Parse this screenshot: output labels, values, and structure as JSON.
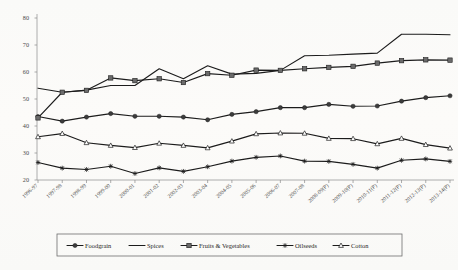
{
  "chart_data": {
    "type": "line",
    "title": "",
    "xlabel": "",
    "ylabel": "",
    "ylim": [
      20,
      80
    ],
    "yticks": [
      20,
      30,
      40,
      50,
      60,
      70,
      80
    ],
    "grid": false,
    "legend_position": "bottom",
    "categories": [
      "1996-97",
      "1997-98",
      "1998-99",
      "1999-00",
      "2000-01",
      "2001-02",
      "2002-03",
      "2003-04",
      "2004-05",
      "2005-06",
      "2006-07",
      "2007-08",
      "2008-09(P)",
      "2009-10(P)",
      "2010-11(P)",
      "2011-12(P)",
      "2012-13(P)",
      "2013-14(P)"
    ],
    "series": [
      {
        "name": "Foodgrain",
        "marker": "filled-circle",
        "values": [
          43.5,
          41.8,
          43.3,
          44.6,
          43.6,
          43.6,
          43.3,
          42.3,
          44.3,
          45.3,
          46.8,
          46.8,
          48.0,
          47.3,
          47.4,
          49.2,
          50.5,
          51.2
        ]
      },
      {
        "name": "Spices",
        "marker": "none",
        "values": [
          54.0,
          52.5,
          53.3,
          55.0,
          55.0,
          61.2,
          57.5,
          62.3,
          59.2,
          59.5,
          60.6,
          66.0,
          66.2,
          66.6,
          67.0,
          74.0,
          74.0,
          73.8
        ]
      },
      {
        "name": "Fruits & Vegetables",
        "marker": "filled-square",
        "values": [
          43.0,
          52.5,
          53.2,
          57.8,
          56.8,
          57.5,
          56.1,
          59.4,
          58.8,
          60.7,
          60.6,
          61.2,
          61.7,
          62.1,
          63.3,
          64.2,
          64.5,
          64.4
        ]
      },
      {
        "name": "Oilseeds",
        "marker": "star",
        "values": [
          26.5,
          24.4,
          23.9,
          25.1,
          22.4,
          24.5,
          23.2,
          24.9,
          27.0,
          28.4,
          28.9,
          27.0,
          26.9,
          25.8,
          24.4,
          27.3,
          27.8,
          26.9
        ]
      },
      {
        "name": "Cotton",
        "marker": "open-triangle",
        "values": [
          36.0,
          37.2,
          33.8,
          32.8,
          32.0,
          33.6,
          32.8,
          31.9,
          34.4,
          37.1,
          37.4,
          37.3,
          35.4,
          35.3,
          33.4,
          35.4,
          33.1,
          31.8
        ]
      }
    ]
  },
  "legend": {
    "items": [
      {
        "label": "Foodgrain",
        "marker": "filled-circle"
      },
      {
        "label": "Spices",
        "marker": "none"
      },
      {
        "label": "Fruits & Vegetables",
        "marker": "filled-square"
      },
      {
        "label": "Oilseeds",
        "marker": "star"
      },
      {
        "label": "Cotton",
        "marker": "open-triangle"
      }
    ]
  },
  "colors": {
    "line": "#1c1c1c",
    "axis": "#9a9a9a",
    "text": "#4a4a4a",
    "legend_border": "#6e6e6e",
    "background": "#fdfdfd"
  }
}
